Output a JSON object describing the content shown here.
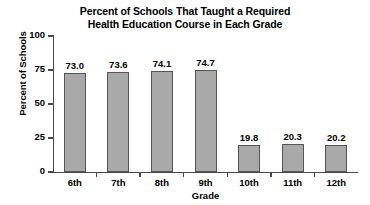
{
  "chart_data": {
    "type": "bar",
    "title": "Percent of Schools That Taught a Required Health Education Course in Each Grade",
    "title_lines": [
      "Percent of Schools That Taught a Required",
      "Health Education Course in Each Grade"
    ],
    "categories": [
      "6th",
      "7th",
      "8th",
      "9th",
      "10th",
      "11th",
      "12th"
    ],
    "values": [
      73.0,
      73.6,
      74.1,
      74.7,
      19.8,
      20.3,
      20.2
    ],
    "value_labels": [
      "73.0",
      "73.6",
      "74.1",
      "74.7",
      "19.8",
      "20.3",
      "20.2"
    ],
    "xlabel": "Grade",
    "ylabel": "Percent of Schools",
    "ylim": [
      0,
      100
    ],
    "yticks": [
      100,
      75,
      50,
      25,
      0
    ],
    "ytick_labels": [
      "100",
      "75",
      "50",
      "25",
      "0"
    ],
    "grid": false,
    "legend": false,
    "bar_color": "#a9a9a9",
    "bar_border_color": "#555555",
    "axis_color": "#4a4a4a",
    "background_color": "#ffffff",
    "text_color": "#000000"
  }
}
